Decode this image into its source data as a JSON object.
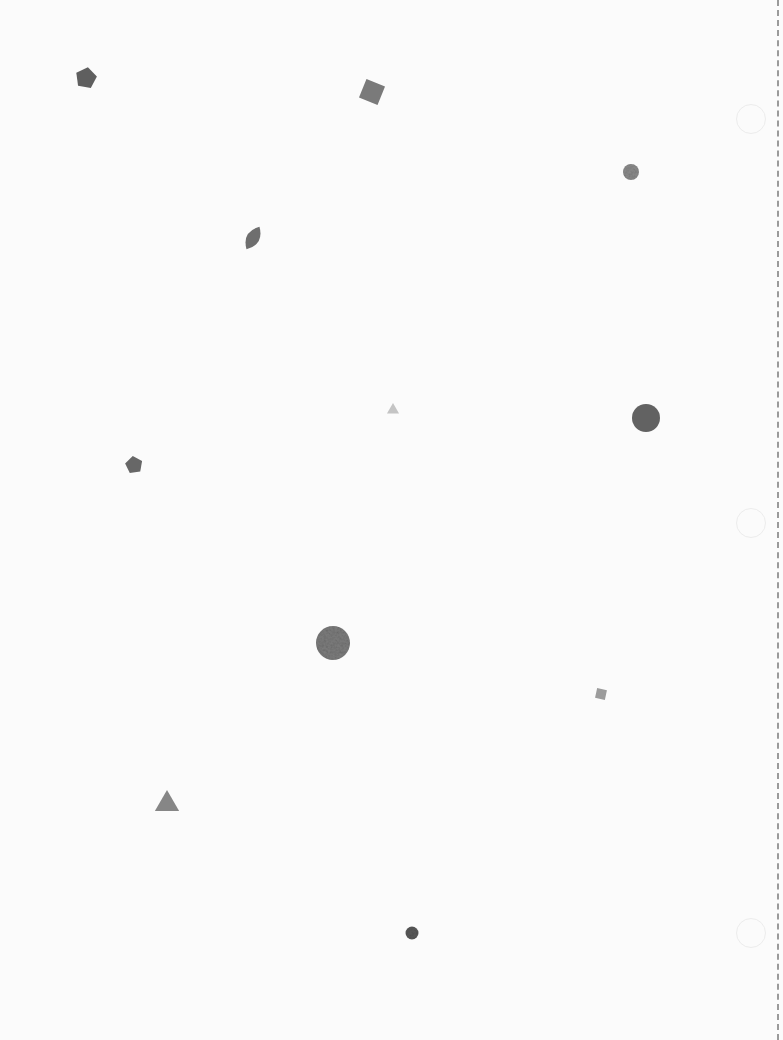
{
  "canvas": {
    "width": 783,
    "height": 1040,
    "background": "#fbfbfb"
  },
  "shapes": [
    {
      "type": "pentagon",
      "cx": 86,
      "cy": 78,
      "size": 22,
      "rotate": 10,
      "color": "#5f5f5f"
    },
    {
      "type": "square",
      "cx": 372,
      "cy": 92,
      "size": 20,
      "rotate": 22,
      "color": "#7a7a7a"
    },
    {
      "type": "circle",
      "cx": 631,
      "cy": 172,
      "size": 16,
      "rotate": 0,
      "color": "#8c8c8c"
    },
    {
      "type": "leaf",
      "cx": 253,
      "cy": 238,
      "size": 26,
      "rotate": 30,
      "color": "#6e6e6e"
    },
    {
      "type": "triangle",
      "cx": 393,
      "cy": 410,
      "size": 14,
      "rotate": 0,
      "color": "#c4c4c4"
    },
    {
      "type": "circle",
      "cx": 646,
      "cy": 418,
      "size": 28,
      "rotate": 0,
      "color": "#626262"
    },
    {
      "type": "pentagon",
      "cx": 134,
      "cy": 465,
      "size": 18,
      "rotate": -8,
      "color": "#676767"
    },
    {
      "type": "textured-circle",
      "cx": 333,
      "cy": 643,
      "size": 34,
      "rotate": 0,
      "color": "#7d7d7d"
    },
    {
      "type": "square",
      "cx": 601,
      "cy": 694,
      "size": 10,
      "rotate": 12,
      "color": "#9c9c9c"
    },
    {
      "type": "triangle",
      "cx": 167,
      "cy": 804,
      "size": 28,
      "rotate": 0,
      "color": "#868686"
    },
    {
      "type": "circle",
      "cx": 412,
      "cy": 933,
      "size": 13,
      "rotate": 0,
      "color": "#5a5a5a"
    }
  ],
  "ghost_circles": [
    {
      "cx": 750,
      "cy": 118
    },
    {
      "cx": 750,
      "cy": 522
    },
    {
      "cx": 750,
      "cy": 932
    }
  ],
  "edge": {
    "style": "dashed",
    "color": "#9a9a9a"
  }
}
